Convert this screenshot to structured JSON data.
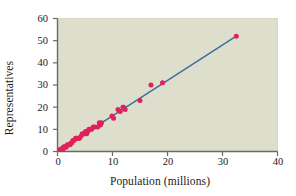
{
  "chart_data": {
    "type": "scatter",
    "title": "",
    "xlabel": "Population (millions)",
    "ylabel": "Representatives",
    "xlim": [
      0,
      40
    ],
    "ylim": [
      0,
      60
    ],
    "xticks": [
      "0",
      "10",
      "20",
      "30",
      "40"
    ],
    "yticks": [
      "0",
      "10",
      "20",
      "30",
      "40",
      "50",
      "60"
    ],
    "grid": false,
    "legend": "none",
    "plot_background_color": "#dedecd",
    "point_color": "#e0215a",
    "line_color": "#3a6f9f",
    "axis_color": "#6b6b60",
    "text_color": "#1a1a1a",
    "series": [
      {
        "name": "States",
        "marker": "filled-circle",
        "points": [
          [
            0.5,
            1
          ],
          [
            0.6,
            1
          ],
          [
            0.7,
            1
          ],
          [
            0.8,
            1
          ],
          [
            0.9,
            1
          ],
          [
            1.0,
            1
          ],
          [
            1.1,
            2
          ],
          [
            1.2,
            2
          ],
          [
            1.3,
            2
          ],
          [
            1.5,
            2
          ],
          [
            1.6,
            2
          ],
          [
            1.8,
            3
          ],
          [
            2.0,
            3
          ],
          [
            2.3,
            3
          ],
          [
            2.5,
            4
          ],
          [
            2.6,
            4
          ],
          [
            2.8,
            5
          ],
          [
            3.0,
            5
          ],
          [
            3.3,
            6
          ],
          [
            3.4,
            6
          ],
          [
            3.6,
            6
          ],
          [
            3.8,
            6
          ],
          [
            4.0,
            6
          ],
          [
            4.3,
            7
          ],
          [
            4.5,
            8
          ],
          [
            4.8,
            8
          ],
          [
            5.0,
            8
          ],
          [
            5.1,
            9
          ],
          [
            5.3,
            8
          ],
          [
            5.4,
            9
          ],
          [
            5.5,
            9
          ],
          [
            5.7,
            10
          ],
          [
            6.0,
            10
          ],
          [
            6.2,
            10
          ],
          [
            6.5,
            11
          ],
          [
            6.8,
            11
          ],
          [
            7.3,
            11
          ],
          [
            7.6,
            13
          ],
          [
            7.8,
            12
          ],
          [
            8.0,
            13
          ],
          [
            9.9,
            16
          ],
          [
            10.2,
            15
          ],
          [
            11.0,
            19
          ],
          [
            11.4,
            18
          ],
          [
            11.9,
            20
          ],
          [
            12.0,
            20
          ],
          [
            12.3,
            19
          ],
          [
            15.0,
            23
          ],
          [
            17.0,
            30
          ],
          [
            19.1,
            31
          ],
          [
            32.5,
            52
          ]
        ]
      }
    ],
    "trendline": {
      "name": "least-squares line",
      "x_start": 0.2,
      "y_start": 0.4,
      "x_end": 32.5,
      "y_end": 52.0
    }
  },
  "axes": {
    "x_title": "Population (millions)",
    "y_title": "Representatives",
    "x_tick_labels": [
      "0",
      "10",
      "20",
      "30",
      "40"
    ],
    "y_tick_labels": [
      "0",
      "10",
      "20",
      "30",
      "40",
      "50",
      "60"
    ]
  }
}
